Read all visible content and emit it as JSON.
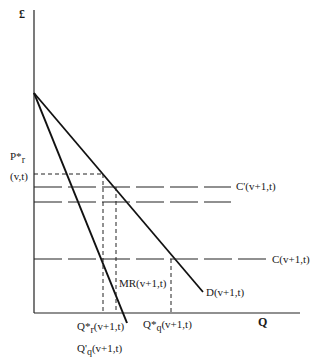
{
  "diagram": {
    "y_axis_label": "£",
    "x_axis_label": "Q",
    "price_label": {
      "main": "P*",
      "sub": "r",
      "paren": "(v,t)"
    },
    "curves": {
      "demand": "D(v+1,t)",
      "marginal_revenue": "MR(v+1,t)",
      "cost_high": "C'(v+1,t)",
      "cost_low": "C(v+1,t)"
    },
    "quantity_labels": {
      "q_star_r": {
        "main": "Q*",
        "sub": "r",
        "rest": "(v+1,t)"
      },
      "q_star_q": {
        "main": "Q*",
        "sub": "q",
        "rest": "(v+1,t)"
      },
      "q_prime_q": {
        "main": "Q'",
        "sub": "q",
        "rest": "(v+1,t)"
      }
    }
  }
}
